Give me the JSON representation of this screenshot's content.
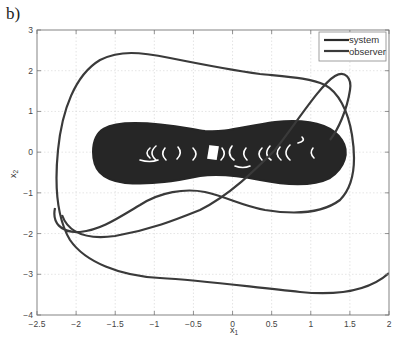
{
  "panel_label": "b)",
  "chart_data": {
    "type": "line",
    "title": "",
    "xlabel": "x1",
    "ylabel": "x2",
    "xlim": [
      -2.5,
      2
    ],
    "ylim": [
      -4,
      3
    ],
    "xticks": [
      -2.5,
      -2,
      -1.5,
      -1,
      -0.5,
      0,
      0.5,
      1,
      1.5,
      2
    ],
    "xtick_labels": [
      "-2.5",
      "-2",
      "-1.5",
      "-1",
      "-0.5",
      "0",
      "0.5",
      "1",
      "1.5",
      "2"
    ],
    "yticks": [
      -4,
      -3,
      -2,
      -1,
      0,
      1,
      2,
      3
    ],
    "ytick_labels": [
      "-4",
      "-3",
      "-2",
      "-1",
      "0",
      "1",
      "2",
      "3"
    ],
    "grid": true,
    "legend_position": "upper right",
    "legend": [
      "system",
      "observer"
    ],
    "series": [
      {
        "name": "system",
        "color": "#2a2a2a",
        "description": "dense chaotic attractor filling a peanut-shaped region",
        "x": [
          -1.5,
          -1.3,
          -1.0,
          -0.6,
          -0.3,
          0.0,
          0.4,
          0.8,
          1.1,
          1.35,
          1.1,
          0.8,
          0.4,
          0.0,
          -0.3,
          -0.6,
          -1.0,
          -1.3,
          -1.5
        ],
        "y": [
          0.0,
          0.55,
          0.72,
          0.68,
          0.55,
          0.5,
          0.6,
          0.75,
          0.65,
          0.0,
          -0.65,
          -0.75,
          -0.6,
          -0.5,
          -0.55,
          -0.68,
          -0.72,
          -0.55,
          0.0
        ]
      },
      {
        "name": "observer",
        "color": "#3a3a3a",
        "description": "transient trajectory converging onto the attractor",
        "x": [
          2.0,
          1.7,
          1.2,
          0.5,
          -0.2,
          -0.9,
          -1.6,
          -2.05,
          -2.2,
          -2.15,
          -1.9,
          -1.3,
          -0.7,
          0.0,
          0.6,
          1.1,
          1.25,
          1.1,
          0.5,
          -0.2,
          -0.9,
          -1.3,
          -1.0,
          -0.4,
          0.5,
          1.1,
          1.2,
          1.05,
          0.6
        ],
        "y": [
          -2.95,
          -3.3,
          -3.4,
          -3.25,
          -3.05,
          -2.9,
          -2.65,
          -2.05,
          -1.0,
          0.5,
          1.9,
          2.4,
          2.3,
          2.0,
          1.8,
          1.7,
          1.9,
          1.5,
          0.6,
          -0.5,
          -1.4,
          -1.3,
          -1.0,
          -0.6,
          -0.3,
          -1.0,
          -1.5,
          -1.75,
          -1.8
        ]
      }
    ]
  }
}
